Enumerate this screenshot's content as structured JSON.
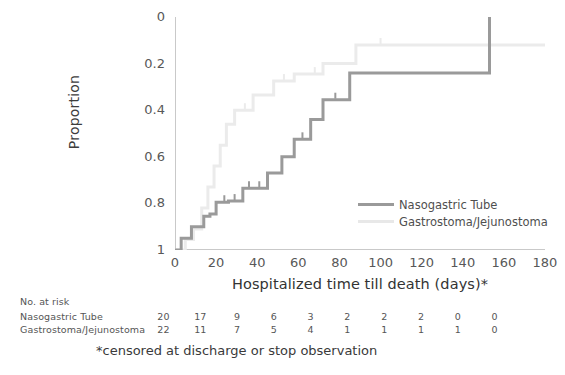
{
  "chart_data": {
    "type": "line",
    "title": "",
    "xlabel": "Hospitalized time till death (days)*",
    "ylabel": "Proportion",
    "xlim": [
      0,
      180
    ],
    "ylim": [
      0,
      1
    ],
    "y_inverted": true,
    "grid": false,
    "legend_position": "inside-right",
    "xticks": [
      0,
      20,
      40,
      60,
      80,
      100,
      120,
      140,
      160,
      180
    ],
    "yticks": [
      0,
      0.2,
      0.4,
      0.6,
      0.8,
      1
    ],
    "ytick_labels": [
      "0",
      "0.2",
      "0.4",
      "0.6",
      "0.8",
      "1"
    ],
    "xtick_labels": [
      "0",
      "20",
      "40",
      "60",
      "80",
      "100",
      "120",
      "140",
      "160",
      "180"
    ],
    "series": [
      {
        "name": "Nasogastric Tube",
        "color": "#9a9a9a",
        "style": "step",
        "points": [
          [
            0,
            1.0
          ],
          [
            3,
            1.0
          ],
          [
            3,
            0.95
          ],
          [
            8,
            0.95
          ],
          [
            8,
            0.9
          ],
          [
            14,
            0.9
          ],
          [
            14,
            0.855
          ],
          [
            17,
            0.855
          ],
          [
            17,
            0.845
          ],
          [
            20,
            0.845
          ],
          [
            20,
            0.795
          ],
          [
            26,
            0.795
          ],
          [
            26,
            0.79
          ],
          [
            33,
            0.79
          ],
          [
            33,
            0.735
          ],
          [
            45,
            0.735
          ],
          [
            45,
            0.67
          ],
          [
            52,
            0.67
          ],
          [
            52,
            0.6
          ],
          [
            58,
            0.6
          ],
          [
            58,
            0.525
          ],
          [
            66,
            0.525
          ],
          [
            66,
            0.44
          ],
          [
            72,
            0.44
          ],
          [
            72,
            0.355
          ],
          [
            85,
            0.355
          ],
          [
            85,
            0.24
          ],
          [
            153,
            0.24
          ],
          [
            153,
            0.0
          ]
        ],
        "censored": [
          [
            24,
            0.795
          ],
          [
            29,
            0.79
          ],
          [
            36,
            0.735
          ],
          [
            41,
            0.735
          ],
          [
            62,
            0.525
          ],
          [
            78,
            0.355
          ]
        ]
      },
      {
        "name": "Gastrostoma/Jejunostoma",
        "color": "#ebebeb",
        "style": "step",
        "points": [
          [
            0,
            1.0
          ],
          [
            5,
            1.0
          ],
          [
            5,
            0.955
          ],
          [
            9,
            0.955
          ],
          [
            9,
            0.91
          ],
          [
            13,
            0.91
          ],
          [
            13,
            0.82
          ],
          [
            16,
            0.82
          ],
          [
            16,
            0.73
          ],
          [
            19,
            0.73
          ],
          [
            19,
            0.64
          ],
          [
            22,
            0.64
          ],
          [
            22,
            0.55
          ],
          [
            25,
            0.55
          ],
          [
            25,
            0.46
          ],
          [
            29,
            0.46
          ],
          [
            29,
            0.4
          ],
          [
            38,
            0.4
          ],
          [
            38,
            0.335
          ],
          [
            48,
            0.335
          ],
          [
            48,
            0.275
          ],
          [
            58,
            0.275
          ],
          [
            58,
            0.245
          ],
          [
            72,
            0.245
          ],
          [
            72,
            0.2
          ],
          [
            88,
            0.2
          ],
          [
            88,
            0.12
          ],
          [
            180,
            0.12
          ]
        ],
        "censored": [
          [
            34,
            0.4
          ],
          [
            53,
            0.275
          ],
          [
            68,
            0.245
          ],
          [
            100,
            0.12
          ],
          [
            153,
            0.12
          ]
        ]
      }
    ]
  },
  "axes": {
    "y_title": "Proportion",
    "x_title": "Hospitalized time till death (days)*"
  },
  "legend": {
    "items": [
      {
        "label": "Nasogastric Tube",
        "color": "#9a9a9a"
      },
      {
        "label": "Gastrostoma/Jejunostoma",
        "color": "#e8e8e8"
      }
    ]
  },
  "risk_table": {
    "title": "No. at risk",
    "rows": [
      {
        "label": "Nasogastric Tube",
        "values": [
          "20",
          "17",
          "9",
          "6",
          "3",
          "2",
          "2",
          "2",
          "0",
          "0"
        ]
      },
      {
        "label": "Gastrostoma/Jejunostoma",
        "values": [
          "22",
          "11",
          "7",
          "5",
          "4",
          "1",
          "1",
          "1",
          "1",
          "0"
        ]
      }
    ]
  },
  "footnote": "*censored at discharge or stop observation",
  "colors": {
    "series_dark": "#9a9a9a",
    "series_light": "#ebebeb",
    "axis": "#c9c9c9",
    "text": "#4a4a4a"
  }
}
